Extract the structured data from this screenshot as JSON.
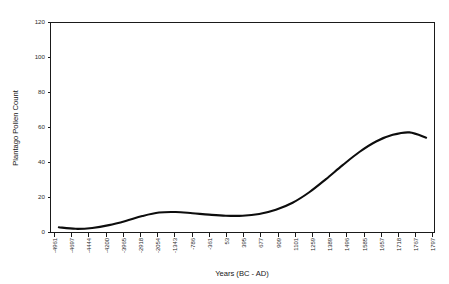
{
  "chart_data": {
    "type": "line",
    "title": "",
    "xlabel": "Years (BC - AD)",
    "ylabel": "Plantago Pollen Count",
    "ylim": [
      0,
      120
    ],
    "yticks": [
      0,
      20,
      40,
      60,
      80,
      100,
      120
    ],
    "ytick_labels": [
      "0",
      "20",
      "40",
      "60",
      "80",
      "100",
      "120"
    ],
    "grid": false,
    "legend": null,
    "categories": [
      "-4961",
      "-4697",
      "-4444",
      "-4200",
      "-3965",
      "-2918",
      "-2054",
      "-1343",
      "-786",
      "-361",
      "53",
      "395",
      "677",
      "909",
      "1101",
      "1259",
      "1389",
      "1496",
      "1585",
      "1657",
      "1718",
      "1767",
      "1797"
    ],
    "series": [
      {
        "name": "Plantago Pollen Count",
        "color": "#0d0d0d",
        "values": [
          3.0,
          2.1,
          2.6,
          4.2,
          6.6,
          9.4,
          11.4,
          11.7,
          11.0,
          10.2,
          9.6,
          9.6,
          10.6,
          13.0,
          17.0,
          23.0,
          30.5,
          38.5,
          46.0,
          52.0,
          55.8,
          57.2,
          54.2
        ]
      }
    ]
  },
  "axes": {
    "x_title": "Years (BC - AD)",
    "y_title": "Plantago Pollen Count",
    "y_labels": [
      "120",
      "100",
      "80",
      "60",
      "40",
      "20",
      "0"
    ],
    "x_labels": [
      "-4961",
      "-4697",
      "-4444",
      "-4200",
      "-3965",
      "-2918",
      "-2054",
      "-1343",
      "-786",
      "-361",
      "53",
      "395",
      "677",
      "909",
      "1101",
      "1259",
      "1389",
      "1496",
      "1585",
      "1657",
      "1718",
      "1767",
      "1797"
    ]
  },
  "style": {
    "line_color": "#0d0d0d",
    "axis_color": "#1a1a1a",
    "text_color": "#2b2b2b",
    "background": "#ffffff"
  }
}
